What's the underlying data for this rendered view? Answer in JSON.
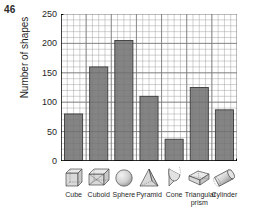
{
  "page_number": "46",
  "chart_data": {
    "type": "bar",
    "title": "",
    "xlabel": "",
    "ylabel": "Number of shapes",
    "categories": [
      "Cube",
      "Cuboid",
      "Sphere",
      "Pyramid",
      "Cone",
      "Triangular prism",
      "Cylinder"
    ],
    "values": [
      80,
      160,
      205,
      110,
      37,
      125,
      87
    ],
    "ylim": [
      0,
      250
    ],
    "ytick_labels": [
      "0",
      "50",
      "100",
      "150",
      "200",
      "250"
    ],
    "ytick_values": [
      0,
      50,
      100,
      150,
      200,
      250
    ],
    "minor_gridline_step": 10,
    "grid": true,
    "legend": "none",
    "bar_color": "#6f6f6f",
    "bar_edge_color": "#3a3a3a",
    "grid_color": "#9a9a9a",
    "axis_color": "#000000",
    "icons": [
      "cube-icon",
      "cuboid-icon",
      "sphere-icon",
      "pyramid-icon",
      "cone-icon",
      "triangular-prism-icon",
      "cylinder-icon"
    ]
  }
}
